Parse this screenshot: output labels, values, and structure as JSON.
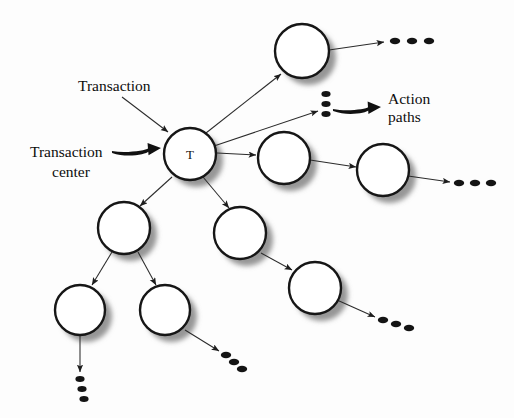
{
  "canvas": {
    "width": 514,
    "height": 418,
    "background": "#fdfdfd"
  },
  "style": {
    "node_fill": "#ffffff",
    "node_stroke": "#161616",
    "node_stroke_width": 2.4,
    "shadow_color": "#8d8d8d",
    "line_color": "#2b2b2b",
    "text_color": "#0d0d0d",
    "dot_color": "#141414"
  },
  "diagram": {
    "center_node": {
      "id": "T",
      "label": "T",
      "cx": 190,
      "cy": 154,
      "r": 26
    },
    "nodes": [
      {
        "id": "n-top-right",
        "label": "",
        "cx": 302,
        "cy": 51,
        "r": 27
      },
      {
        "id": "n-right-mid",
        "label": "",
        "cx": 284,
        "cy": 158,
        "r": 26
      },
      {
        "id": "n-right-far",
        "label": "",
        "cx": 383,
        "cy": 170,
        "r": 26
      },
      {
        "id": "n-left-branch",
        "label": "",
        "cx": 124,
        "cy": 228,
        "r": 26
      },
      {
        "id": "n-mid-lower",
        "label": "",
        "cx": 240,
        "cy": 233,
        "r": 26
      },
      {
        "id": "n-lower-right",
        "label": "",
        "cx": 315,
        "cy": 288,
        "r": 26
      },
      {
        "id": "n-bottom-left",
        "label": "",
        "cx": 80,
        "cy": 310,
        "r": 25
      },
      {
        "id": "n-bottom-mid",
        "label": "",
        "cx": 165,
        "cy": 310,
        "r": 25
      }
    ],
    "edges": [
      {
        "id": "edge-t-to-top-right",
        "from": "T",
        "to": "n-top-right",
        "x1": 206,
        "y1": 133,
        "x2": 281,
        "y2": 74
      },
      {
        "id": "edge-t-to-dots-stack",
        "from": "T",
        "to": "dots-stack",
        "x1": 214,
        "y1": 146,
        "x2": 318,
        "y2": 111
      },
      {
        "id": "edge-t-to-right-mid",
        "from": "T",
        "to": "n-right-mid",
        "x1": 217,
        "y1": 153,
        "x2": 256,
        "y2": 155
      },
      {
        "id": "edge-t-to-mid-lower",
        "from": "T",
        "to": "n-mid-lower",
        "x1": 203,
        "y1": 177,
        "x2": 229,
        "y2": 208
      },
      {
        "id": "edge-t-to-left-branch",
        "from": "T",
        "to": "n-left-branch",
        "x1": 172,
        "y1": 177,
        "x2": 140,
        "y2": 206
      },
      {
        "id": "edge-topright-to-dots",
        "from": "n-top-right",
        "to": "dots-top-right",
        "x1": 329,
        "y1": 50,
        "x2": 384,
        "y2": 42
      },
      {
        "id": "edge-rightmid-to-far",
        "from": "n-right-mid",
        "to": "n-right-far",
        "x1": 310,
        "y1": 160,
        "x2": 356,
        "y2": 167
      },
      {
        "id": "edge-far-to-dots",
        "from": "n-right-far",
        "to": "dots-right-far",
        "x1": 408,
        "y1": 176,
        "x2": 450,
        "y2": 182
      },
      {
        "id": "edge-leftbranch-to-bl",
        "from": "n-left-branch",
        "to": "n-bottom-left",
        "x1": 112,
        "y1": 252,
        "x2": 92,
        "y2": 285
      },
      {
        "id": "edge-leftbranch-to-bm",
        "from": "n-left-branch",
        "to": "n-bottom-mid",
        "x1": 138,
        "y1": 252,
        "x2": 156,
        "y2": 285
      },
      {
        "id": "edge-midlower-to-lr",
        "from": "n-mid-lower",
        "to": "n-lower-right",
        "x1": 261,
        "y1": 253,
        "x2": 292,
        "y2": 270
      },
      {
        "id": "edge-lowerright-to-dots",
        "from": "n-lower-right",
        "to": "dots-lower-right",
        "x1": 337,
        "y1": 300,
        "x2": 375,
        "y2": 317
      },
      {
        "id": "edge-bl-to-dots",
        "from": "n-bottom-left",
        "to": "dots-bottom",
        "x1": 80,
        "y1": 336,
        "x2": 80,
        "y2": 372
      },
      {
        "id": "edge-bm-to-dots",
        "from": "n-bottom-mid",
        "to": "dots-bottom-mid",
        "x1": 185,
        "y1": 330,
        "x2": 219,
        "y2": 351
      }
    ],
    "dot_groups": [
      {
        "id": "dots-top-right",
        "orientation": "horizontal",
        "count": 3,
        "x": 395,
        "y": 41,
        "dx": 17,
        "dy": 0
      },
      {
        "id": "dots-stack",
        "orientation": "vertical",
        "count": 3,
        "x": 326,
        "y": 94,
        "dx": 0,
        "dy": 10
      },
      {
        "id": "dots-right-far",
        "orientation": "horizontal",
        "count": 3,
        "x": 459,
        "y": 183,
        "dx": 16,
        "dy": 0
      },
      {
        "id": "dots-lower-right",
        "orientation": "diagonal",
        "count": 3,
        "x": 383,
        "y": 320,
        "dx": 13,
        "dy": 4
      },
      {
        "id": "dots-bottom-mid",
        "orientation": "diagonal",
        "count": 3,
        "x": 226,
        "y": 355,
        "dx": 8,
        "dy": 7
      },
      {
        "id": "dots-bottom",
        "orientation": "vertical",
        "count": 3,
        "x": 80,
        "y": 379,
        "dx": 2,
        "dy": 10
      }
    ],
    "annotations": [
      {
        "id": "annot-transaction",
        "text": "Transaction",
        "text_x": 78,
        "text_y": 91,
        "anchor": "start",
        "pointer": {
          "type": "thin-arrow",
          "x1": 122,
          "y1": 97,
          "x2": 168,
          "y2": 132
        }
      },
      {
        "id": "annot-transaction-center",
        "line1": "Transaction",
        "line2": "center",
        "text_x": 30,
        "text_y": 157,
        "line2_x": 52,
        "line2_y": 177,
        "anchor": "start",
        "pointer": {
          "type": "thick-arrow",
          "x1": 112,
          "y1": 152,
          "x2": 161,
          "y2": 148
        }
      },
      {
        "id": "annot-action-paths",
        "line1": "Action",
        "line2": "paths",
        "text_x": 388,
        "text_y": 104,
        "line2_x": 388,
        "line2_y": 122,
        "anchor": "start",
        "pointer": {
          "type": "thick-arrow",
          "x1": 333,
          "y1": 110,
          "x2": 381,
          "y2": 107
        }
      }
    ]
  }
}
